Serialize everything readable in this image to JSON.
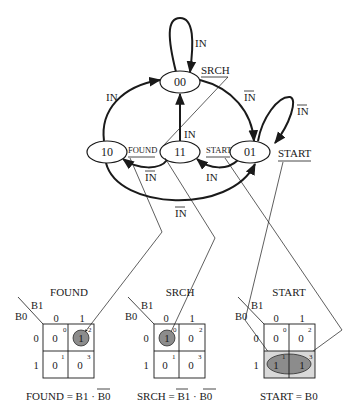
{
  "states": [
    {
      "id": "00",
      "label": "00"
    },
    {
      "id": "10",
      "label": "10"
    },
    {
      "id": "11",
      "label": "11"
    },
    {
      "id": "01",
      "label": "01"
    }
  ],
  "transitions": [
    {
      "from": "00",
      "to": "00",
      "label": "IN",
      "negated": false
    },
    {
      "from": "00",
      "to": "01",
      "label": "IN",
      "negated": true
    },
    {
      "from": "01",
      "to": "01",
      "label": "IN",
      "negated": true
    },
    {
      "from": "01",
      "to": "11",
      "label": "IN",
      "negated": false
    },
    {
      "from": "11",
      "to": "10",
      "label": "IN",
      "negated": true
    },
    {
      "from": "11",
      "to": "00",
      "label": "IN",
      "negated": false
    },
    {
      "from": "10",
      "to": "00",
      "label": "IN",
      "negated": false
    },
    {
      "from": "10",
      "to": "01",
      "label": "IN",
      "negated": true
    }
  ],
  "outputs": {
    "srch": "SRCH",
    "found": "FOUND",
    "start_small": "START",
    "start_large": "START"
  },
  "kmaps": [
    {
      "title": "FOUND",
      "row_var": "B0",
      "col_var": "B1",
      "col_headers": [
        "0",
        "1"
      ],
      "row_headers": [
        "0",
        "1"
      ],
      "cells": [
        {
          "index": "0",
          "value": "0"
        },
        {
          "index": "2",
          "value": "1"
        },
        {
          "index": "1",
          "value": "0"
        },
        {
          "index": "3",
          "value": "0"
        }
      ],
      "equation": {
        "lhs": "FOUND = ",
        "t1": "B1",
        "dot": " · ",
        "t2": "B0",
        "t1_neg": false,
        "t2_neg": true
      }
    },
    {
      "title": "SRCH",
      "row_var": "B0",
      "col_var": "B1",
      "col_headers": [
        "0",
        "1"
      ],
      "row_headers": [
        "0",
        "1"
      ],
      "cells": [
        {
          "index": "0",
          "value": "1"
        },
        {
          "index": "2",
          "value": "0"
        },
        {
          "index": "1",
          "value": "0"
        },
        {
          "index": "3",
          "value": "0"
        }
      ],
      "equation": {
        "lhs": "SRCH = ",
        "t1": "B1",
        "dot": " · ",
        "t2": "B0",
        "t1_neg": true,
        "t2_neg": true
      }
    },
    {
      "title": "START",
      "row_var": "B0",
      "col_var": "B1",
      "col_headers": [
        "0",
        "1"
      ],
      "row_headers": [
        "0",
        "1"
      ],
      "cells": [
        {
          "index": "0",
          "value": "0"
        },
        {
          "index": "2",
          "value": "0"
        },
        {
          "index": "1",
          "value": "1"
        },
        {
          "index": "3",
          "value": "1"
        }
      ],
      "equation": {
        "lhs": "START = ",
        "t1": "B0"
      }
    }
  ],
  "colors": {
    "ink": "#1a1a1a",
    "highlight": "#8c8c8c"
  }
}
